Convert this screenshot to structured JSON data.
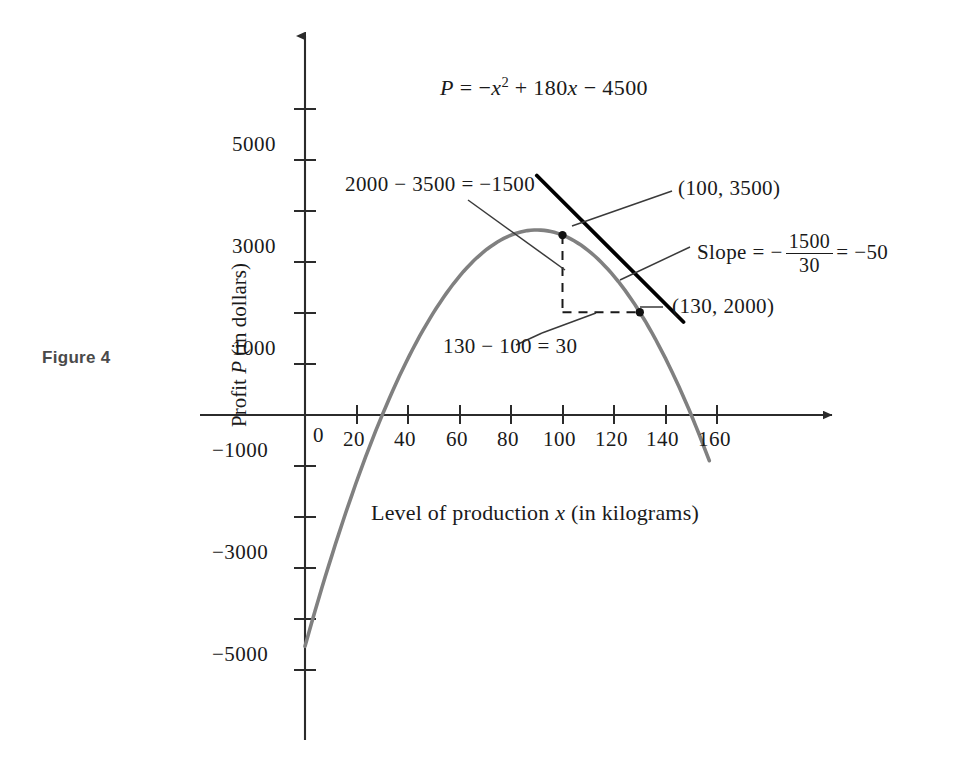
{
  "figure": {
    "label": "Figure 4",
    "equation_plain": "P = -x^2 + 180x - 4500",
    "equation_parts": {
      "lhs": "P",
      "eq": "=",
      "term1_sign": "−",
      "term1_var": "x",
      "term1_exp": "2",
      "plus": "+",
      "term2": "180",
      "term2_var": "x",
      "minus": "−",
      "term3": "4500"
    }
  },
  "axes": {
    "x": {
      "title_prefix": "Level of production ",
      "title_var": "x",
      "title_suffix": " (in kilograms)",
      "tick_labels": [
        "0",
        "20",
        "40",
        "60",
        "80",
        "100",
        "120",
        "140",
        "160"
      ],
      "tick_values": [
        0,
        20,
        40,
        60,
        80,
        100,
        120,
        140,
        160
      ],
      "range": [
        -12,
        175
      ],
      "arrow": true
    },
    "y": {
      "title_prefix": "Profit ",
      "title_var": "P",
      "title_suffix": " (in dollars)",
      "tick_labels": [
        "5000",
        "3000",
        "1000",
        "−1000",
        "−3000",
        "−5000"
      ],
      "labeled_values": [
        5000,
        3000,
        1000,
        -1000,
        -3000,
        -5000
      ],
      "unlabeled_values": [
        6000,
        4000,
        2000,
        -2000,
        -4000
      ],
      "range": [
        -5600,
        6200
      ],
      "arrow": true
    }
  },
  "annotations": {
    "rise": "2000 − 3500 = −1500",
    "run": "130 − 100 = 30",
    "point_a": "(100, 3500)",
    "point_b": "(130, 2000)",
    "slope_prefix": "Slope = −",
    "slope_numerator": "1500",
    "slope_denominator": "30",
    "slope_eq": "=",
    "slope_value": "−50"
  },
  "colors": {
    "curve": "#808080",
    "tangent": "#000000",
    "axis": "#2b2b2b",
    "dashed": "#1a1a1a",
    "leader": "#3a3a3a",
    "figure_label": "#4a4a4a",
    "background": "#ffffff"
  },
  "chart_data": {
    "type": "line",
    "title": "",
    "subtitle": "",
    "xlabel": "Level of production x (in kilograms)",
    "ylabel": "Profit P (in dollars)",
    "equation": "P = -x^2 + 180x - 4500",
    "xlim": [
      -12,
      175
    ],
    "ylim": [
      -5600,
      6200
    ],
    "grid": false,
    "legend": "none",
    "xticks": [
      0,
      20,
      40,
      60,
      80,
      100,
      120,
      140,
      160
    ],
    "yticks": [
      -5000,
      -4000,
      -3000,
      -2000,
      -1000,
      1000,
      2000,
      3000,
      4000,
      5000,
      6000
    ],
    "ytick_labels_shown": [
      5000,
      3000,
      1000,
      -1000,
      -3000,
      -5000
    ],
    "series": [
      {
        "name": "P = -x^2 + 180x - 4500",
        "kind": "parabola",
        "color": "#808080",
        "domain": [
          0,
          157
        ],
        "vertex": [
          90,
          3600
        ],
        "roots": [
          30,
          150
        ],
        "x": [
          0,
          10,
          20,
          30,
          40,
          50,
          60,
          70,
          80,
          90,
          100,
          110,
          120,
          130,
          140,
          150,
          157
        ],
        "y": [
          -4500,
          -2800,
          -1300,
          0,
          1100,
          2000,
          2700,
          3200,
          3500,
          3600,
          3500,
          3200,
          2700,
          2000,
          1100,
          0,
          -1051
        ]
      },
      {
        "name": "tangent line at x = 115",
        "kind": "line",
        "color": "#000000",
        "slope": -50,
        "x": [
          90,
          147
        ],
        "y": [
          4660,
          1810
        ]
      }
    ],
    "points": [
      {
        "label": "(100, 3500)",
        "x": 100,
        "y": 3500
      },
      {
        "label": "(130, 2000)",
        "x": 130,
        "y": 2000
      }
    ],
    "annotations": [
      {
        "text": "2000 − 3500 = −1500",
        "refers_to": "vertical dashed segment (rise)"
      },
      {
        "text": "130 − 100 = 30",
        "refers_to": "horizontal dashed segment (run)"
      },
      {
        "text": "Slope = − 1500/30 = −50",
        "refers_to": "secant/tangent line"
      }
    ]
  }
}
